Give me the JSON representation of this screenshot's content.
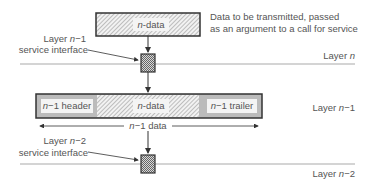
{
  "top_data": {
    "label_var": "n",
    "label_rest": "-data"
  },
  "annotation": {
    "line1": "Data to be transmitted, passed",
    "line2": "as an argument to a call for service"
  },
  "interface_upper": {
    "line1_prefix": "Layer ",
    "line1_var": "n",
    "line1_suffix": "−1",
    "line2": "service interface"
  },
  "interface_lower": {
    "line1_prefix": "Layer ",
    "line1_var": "n",
    "line1_suffix": "−2",
    "line2": "service interface"
  },
  "layers": [
    {
      "prefix": "Layer ",
      "var": "n",
      "suffix": ""
    },
    {
      "prefix": "Layer ",
      "var": "n",
      "suffix": "−1"
    },
    {
      "prefix": "Layer ",
      "var": "n",
      "suffix": "−2"
    }
  ],
  "pdu": {
    "header": {
      "var": "n",
      "rest": "−1 header"
    },
    "data": {
      "var": "n",
      "rest": "-data"
    },
    "trailer": {
      "var": "n",
      "rest": "−1 trailer"
    }
  },
  "span_label": {
    "var": "n",
    "rest": "−1 data"
  },
  "colors": {
    "line": "#aaaaaa",
    "box_border": "#333333",
    "header_fill": "#bbbbbb",
    "text": "#555555"
  }
}
